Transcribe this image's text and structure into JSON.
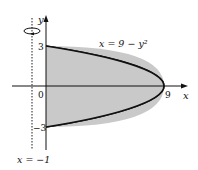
{
  "figure": {
    "type": "region-rotation-diagram",
    "curve_label": "x = 9 − y²",
    "curve_equation": {
      "lhs": "x",
      "rhs_const": "9",
      "rhs_var": "y",
      "exponent": "2"
    },
    "axis_of_rotation_label": "x = −1",
    "axes": {
      "x_label": "x",
      "y_label": "y"
    },
    "ticks": {
      "y_top": "3",
      "origin": "0",
      "y_bottom": "−3",
      "x_vertex": "9"
    },
    "rotation_icon": "rotation-arrow-icon",
    "colors": {
      "fill": "#c9c9c9",
      "stroke": "#111111",
      "background": "#ffffff"
    }
  }
}
